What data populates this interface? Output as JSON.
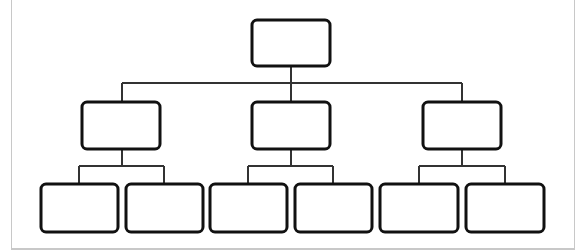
{
  "diagram": {
    "type": "org-chart",
    "levels": 3,
    "colors": {
      "box_stroke": "#111111",
      "line_stroke": "#333333",
      "frame": "#c8c8c8",
      "background": "#ffffff"
    },
    "root": {
      "label": "",
      "box": [
        252,
        20,
        78,
        46
      ]
    },
    "children": [
      {
        "label": "",
        "box": [
          82,
          102,
          78,
          47
        ],
        "children": [
          {
            "label": "",
            "box": [
              41,
              184,
              77,
              48
            ]
          },
          {
            "label": "",
            "box": [
              126,
              184,
              77,
              48
            ]
          }
        ]
      },
      {
        "label": "",
        "box": [
          252,
          102,
          78,
          47
        ],
        "children": [
          {
            "label": "",
            "box": [
              210,
              184,
              77,
              48
            ]
          },
          {
            "label": "",
            "box": [
              295,
              184,
              77,
              48
            ]
          }
        ]
      },
      {
        "label": "",
        "box": [
          423,
          102,
          78,
          47
        ],
        "children": [
          {
            "label": "",
            "box": [
              380,
              184,
              78,
              48
            ]
          },
          {
            "label": "",
            "box": [
              466,
              184,
              78,
              48
            ]
          }
        ]
      }
    ]
  }
}
